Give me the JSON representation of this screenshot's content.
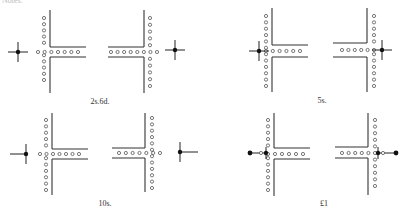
{
  "header": {
    "clipped_text": "Notes."
  },
  "figure": {
    "panels": [
      {
        "label": "2s.6d.",
        "label_pos": [
          100,
          97
        ],
        "junctions": [
          {
            "side": "left",
            "wall_x": 50,
            "wall_y": [
              10,
              93
            ],
            "arm_y": [
              47,
              57
            ],
            "arm_x_end": 86,
            "dot_col_x": 44,
            "dot_col_y": [
              18,
              80
            ],
            "dot_row_y": 52,
            "dot_row_x": [
              38,
              78
            ],
            "marker": {
              "type": "cross",
              "x": 18,
              "y": 52
            }
          },
          {
            "side": "right",
            "wall_x": 144,
            "wall_y": [
              10,
              93
            ],
            "arm_y": [
              47,
              57
            ],
            "arm_x_end": 108,
            "dot_col_x": 150,
            "dot_col_y": [
              18,
              86
            ],
            "dot_row_y": 52,
            "dot_row_x": [
              111,
              157
            ],
            "marker": {
              "type": "cross",
              "x": 175,
              "y": 50
            }
          }
        ]
      },
      {
        "label": "5s.",
        "label_pos": [
          322,
          96
        ],
        "junctions": [
          {
            "side": "left",
            "wall_x": 272,
            "wall_y": [
              8,
              92
            ],
            "arm_y": [
              45,
              57
            ],
            "arm_x_end": 308,
            "dot_col_x": 266,
            "dot_col_y": [
              16,
              86
            ],
            "dot_row_y": 51,
            "dot_row_x": [
              266,
              300
            ],
            "marker": {
              "type": "cross",
              "x": 259,
              "y": 51
            }
          },
          {
            "side": "right",
            "wall_x": 367,
            "wall_y": [
              8,
              92
            ],
            "arm_y": [
              43,
              57
            ],
            "arm_x_end": 333,
            "dot_col_x": 374,
            "dot_col_y": [
              16,
              86
            ],
            "dot_row_y": 50,
            "dot_row_x": [
              342,
              374
            ],
            "marker": {
              "type": "cross",
              "x": 382,
              "y": 50
            }
          }
        ]
      },
      {
        "label": "10s.",
        "label_pos": [
          105,
          199
        ],
        "junctions": [
          {
            "side": "left",
            "wall_x": 52,
            "wall_y": [
              113,
              195
            ],
            "arm_y": [
              149,
              159
            ],
            "arm_x_end": 88,
            "dot_col_x": 46,
            "dot_col_y": [
              120,
              190
            ],
            "dot_row_y": 154,
            "dot_row_x": [
              40,
              79
            ],
            "marker": {
              "type": "cross-left",
              "x": 26,
              "y": 154
            }
          },
          {
            "side": "right",
            "wall_x": 145,
            "wall_y": [
              113,
              192
            ],
            "arm_y": [
              148,
              158
            ],
            "arm_x_end": 112,
            "dot_col_x": 152,
            "dot_col_y": [
              118,
              188
            ],
            "dot_row_y": 153,
            "dot_row_x": [
              119,
              160
            ],
            "marker": {
              "type": "cross-right",
              "x": 180,
              "y": 152
            }
          }
        ]
      },
      {
        "label": "£1",
        "label_pos": [
          324,
          199
        ],
        "junctions": [
          {
            "side": "left",
            "wall_x": 274,
            "wall_y": [
              113,
              196
            ],
            "arm_y": [
              148,
              159
            ],
            "arm_x_end": 310,
            "dot_col_x": 268,
            "dot_col_y": [
              120,
              190
            ],
            "dot_row_y": 154,
            "dot_row_x": [
              268,
              303
            ],
            "marker": {
              "type": "rod-left",
              "x": 266,
              "y": 153,
              "end_x": 250
            }
          },
          {
            "side": "right",
            "wall_x": 368,
            "wall_y": [
              113,
              195
            ],
            "arm_y": [
              147,
              158
            ],
            "arm_x_end": 335,
            "dot_col_x": 375,
            "dot_col_y": [
              120,
              186
            ],
            "dot_row_y": 153,
            "dot_row_x": [
              342,
              375
            ],
            "marker": {
              "type": "rod-right",
              "x": 378,
              "y": 153,
              "end_x": 396
            }
          }
        ]
      }
    ]
  },
  "colors": {
    "ink": "#222222",
    "paper": "#ffffff"
  }
}
